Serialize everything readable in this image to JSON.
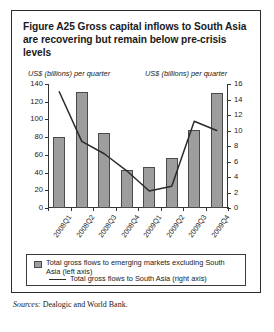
{
  "figure": {
    "title": "Figure A25  Gross capital inflows to South Asia are recovering but remain below pre-crisis levels",
    "left_axis_unit": "US$ (billions) per quarter",
    "right_axis_unit": "US$ (billions) per quarter",
    "sources_label": "Sources:",
    "sources_text": " Dealogic and World Bank."
  },
  "legend": {
    "bars_label": "Total gross flows to emerging markets excluding South Asia (left axis)",
    "line_label": "Total gross flows to South Asia (right axis)"
  },
  "colors": {
    "bar_fill": "#9d9d9d",
    "bar_stroke": "#4a4a4a",
    "line": "#2b2b2b",
    "axis": "#333333",
    "border": "#2b2b2b"
  },
  "chart_data": {
    "type": "bar",
    "title": "Figure A25  Gross capital inflows to South Asia are recovering but remain below pre-crisis levels",
    "xlabel": "",
    "ylabel": "US$ (billions) per quarter",
    "y2label": "US$ (billions) per quarter",
    "ylim": [
      0,
      140
    ],
    "y2lim": [
      0,
      16
    ],
    "yticks": [
      0,
      20,
      40,
      60,
      80,
      100,
      120,
      140
    ],
    "y2ticks": [
      0,
      2,
      4,
      6,
      8,
      10,
      12,
      14,
      16
    ],
    "grid": false,
    "legend_position": "bottom",
    "categories": [
      "2008Q1",
      "2008Q2",
      "2008Q3",
      "2008Q4",
      "2009Q1",
      "2009Q2",
      "2009Q3",
      "2009Q4"
    ],
    "series": [
      {
        "name": "Total gross flows to emerging markets excluding South Asia (left axis)",
        "type": "bar",
        "axis": "left",
        "values": [
          80,
          131,
          85,
          43,
          46,
          56,
          88,
          130
        ]
      },
      {
        "name": "Total gross flows to South Asia (right axis)",
        "type": "line",
        "axis": "right",
        "values": [
          15.0,
          8.6,
          7.0,
          4.8,
          2.2,
          2.8,
          11.2,
          10.0
        ]
      }
    ]
  }
}
